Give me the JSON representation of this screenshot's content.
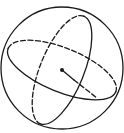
{
  "diagram": {
    "title": "",
    "stroke_color": "#1a1a1a",
    "background_color": "#ffffff",
    "sphere": {
      "cx": 62,
      "cy": 68,
      "r": 61
    },
    "great_circle_horizontal": {
      "cx": 62,
      "cy": 70,
      "rx": 58,
      "ry": 22,
      "rotate": 22,
      "hidden_part": "upper-back"
    },
    "great_circle_vertical": {
      "cx": 62,
      "cy": 70,
      "rx": 22,
      "ry": 58,
      "rotate": 22,
      "hidden_part": "left-back"
    },
    "center_point": {
      "x": 62,
      "y": 70
    },
    "radius_line": {
      "x1": 62,
      "y1": 70,
      "x2": 97,
      "y2": 98
    },
    "labels": []
  }
}
